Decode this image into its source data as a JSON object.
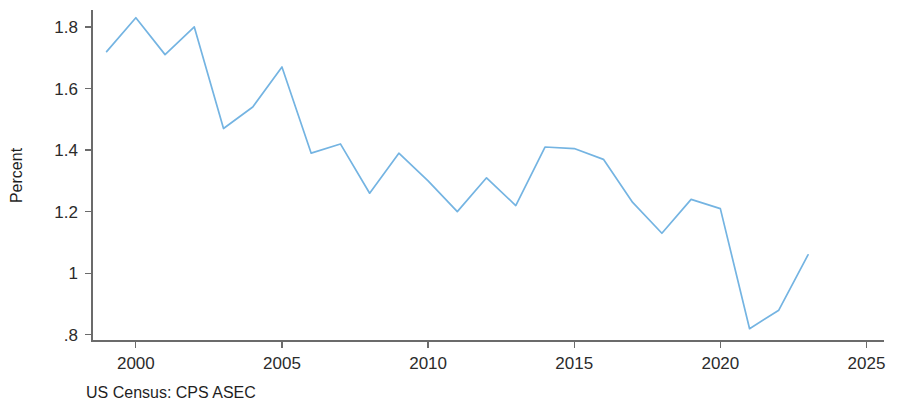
{
  "chart_data": {
    "type": "line",
    "title": "",
    "subtitle": "",
    "xlabel": "",
    "ylabel": "Percent",
    "source_note": "US Census: CPS ASEC",
    "xlim": [
      1998.5,
      2025.6
    ],
    "ylim": [
      0.78,
      1.855
    ],
    "grid": false,
    "legend": "none",
    "line_color": "#74b4e2",
    "axis_color": "#6b6b6b",
    "x_ticks": [
      2000,
      2005,
      2010,
      2015,
      2020,
      2025
    ],
    "x_tick_labels": [
      "2000",
      "2005",
      "2010",
      "2015",
      "2020",
      "2025"
    ],
    "y_ticks": [
      0.8,
      1.0,
      1.2,
      1.4,
      1.6,
      1.8
    ],
    "y_tick_labels": [
      ".8",
      "1",
      "1.2",
      "1.4",
      "1.6",
      "1.8"
    ],
    "x": [
      1999,
      2000,
      2001,
      2002,
      2003,
      2004,
      2005,
      2006,
      2007,
      2008,
      2009,
      2010,
      2011,
      2012,
      2013,
      2014,
      2015,
      2016,
      2017,
      2018,
      2019,
      2020,
      2021,
      2022,
      2023
    ],
    "values": [
      1.72,
      1.83,
      1.71,
      1.8,
      1.47,
      1.54,
      1.67,
      1.39,
      1.42,
      1.26,
      1.39,
      1.3,
      1.2,
      1.31,
      1.22,
      1.41,
      1.405,
      1.37,
      1.23,
      1.13,
      1.24,
      1.21,
      0.82,
      0.88,
      1.06
    ],
    "series": [
      {
        "name": "Percent",
        "values": [
          1.72,
          1.83,
          1.71,
          1.8,
          1.47,
          1.54,
          1.67,
          1.39,
          1.42,
          1.26,
          1.39,
          1.3,
          1.2,
          1.31,
          1.22,
          1.41,
          1.405,
          1.37,
          1.23,
          1.13,
          1.24,
          1.21,
          0.82,
          0.88,
          1.06
        ]
      }
    ]
  },
  "plot_geometry": {
    "left": 92,
    "right": 884,
    "top": 10,
    "bottom": 341
  }
}
